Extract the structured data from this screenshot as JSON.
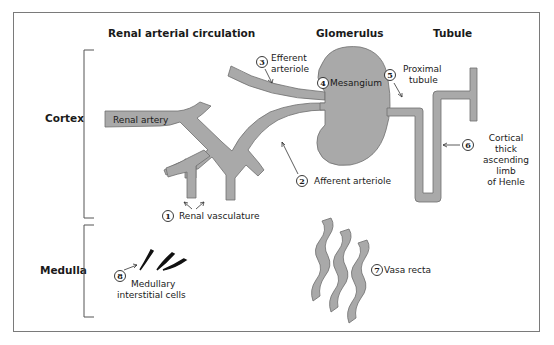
{
  "columns": {
    "renal_arterial_circulation": "Renal arterial circulation",
    "glomerulus": "Glomerulus",
    "tubule": "Tubule"
  },
  "regions": {
    "cortex": "Cortex",
    "medulla": "Medulla"
  },
  "structures": {
    "renal_artery": "Renal artery"
  },
  "callouts": [
    {
      "number": "1",
      "label": "Renal vasculature"
    },
    {
      "number": "2",
      "label": "Afferent arteriole"
    },
    {
      "number": "3",
      "label_lines": [
        "Efferent",
        "arteriole"
      ]
    },
    {
      "number": "4",
      "label": "Mesangium"
    },
    {
      "number": "5",
      "label_lines": [
        "Proximal",
        "tubule"
      ]
    },
    {
      "number": "6",
      "label_lines": [
        "Cortical",
        "thick",
        "ascending",
        "limb",
        "of Henle"
      ]
    },
    {
      "number": "7",
      "label": "Vasa recta"
    },
    {
      "number": "8",
      "label_lines": [
        "Medullary",
        "interstitial cells"
      ]
    }
  ],
  "colors": {
    "vessel_fill": "#a9a9a9",
    "vessel_stroke": "#6e6e6e",
    "cell_fill": "#111111",
    "frame": "#7a7a7a"
  }
}
